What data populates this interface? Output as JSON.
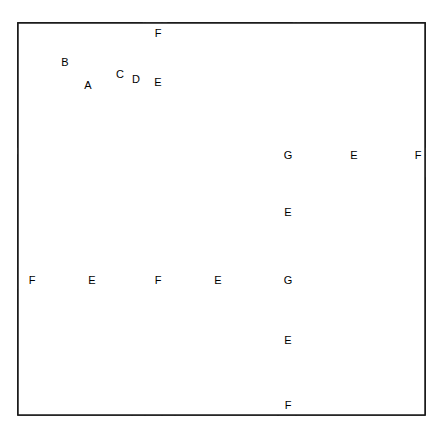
{
  "diagram": {
    "type": "quilt-piecing-diagram",
    "background_color": "#ffffff",
    "line_color": "#1a1a1a",
    "outer_frame": {
      "x": 18,
      "y": 23,
      "width": 407,
      "height": 392
    },
    "grid": {
      "rows": 3,
      "cols": 3,
      "blocks_total": 9
    },
    "piece_labels": [
      "A",
      "B",
      "C",
      "D",
      "E",
      "F",
      "G"
    ],
    "legend": {
      "A": "center square",
      "B": "corner triangle on center square",
      "C": "short log strip",
      "D": "long log strip",
      "E": "long sashing strip",
      "F": "small corner square",
      "G": "sashing square"
    },
    "labels": [
      {
        "text": "A",
        "x": 88,
        "y": 85
      },
      {
        "text": "B",
        "x": 65,
        "y": 62
      },
      {
        "text": "C",
        "x": 120,
        "y": 74
      },
      {
        "text": "D",
        "x": 136,
        "y": 79
      },
      {
        "text": "E",
        "x": 158,
        "y": 82
      },
      {
        "text": "F",
        "x": 158,
        "y": 33
      },
      {
        "text": "G",
        "x": 288,
        "y": 155
      },
      {
        "text": "E",
        "x": 354,
        "y": 155
      },
      {
        "text": "F",
        "x": 418,
        "y": 155
      },
      {
        "text": "E",
        "x": 288,
        "y": 212
      },
      {
        "text": "F",
        "x": 32,
        "y": 280
      },
      {
        "text": "E",
        "x": 92,
        "y": 280
      },
      {
        "text": "F",
        "x": 158,
        "y": 280
      },
      {
        "text": "E",
        "x": 218,
        "y": 280
      },
      {
        "text": "G",
        "x": 288,
        "y": 280
      },
      {
        "text": "E",
        "x": 288,
        "y": 340
      },
      {
        "text": "F",
        "x": 288,
        "y": 405
      }
    ],
    "blocks": [
      {
        "id": "block-r1c1",
        "row": 1,
        "col": 1,
        "x": 18,
        "y": 23,
        "size": 124,
        "rotation": 0,
        "diagonal": "up-right"
      },
      {
        "id": "block-r1c2",
        "row": 1,
        "col": 2,
        "x": 168,
        "y": 23,
        "size": 124,
        "rotation": 90,
        "diagonal": "down-right"
      },
      {
        "id": "block-r1c3",
        "row": 1,
        "col": 3,
        "x": 301,
        "y": 23,
        "size": 124,
        "rotation": 90,
        "diagonal": "down-right"
      },
      {
        "id": "block-r2c1",
        "row": 2,
        "col": 1,
        "x": 18,
        "y": 155,
        "size": 124,
        "rotation": 180,
        "diagonal": "up-right"
      },
      {
        "id": "block-r2c2",
        "row": 2,
        "col": 2,
        "x": 150,
        "y": 155,
        "size": 124,
        "rotation": 180,
        "diagonal": "up-right"
      },
      {
        "id": "block-r2c3",
        "row": 2,
        "col": 3,
        "x": 301,
        "y": 178,
        "size": 124,
        "rotation": 270,
        "diagonal": "up-right"
      },
      {
        "id": "block-r3c1",
        "row": 3,
        "col": 1,
        "x": 18,
        "y": 290,
        "size": 124,
        "rotation": 0,
        "diagonal": "down-right"
      },
      {
        "id": "block-r3c2",
        "row": 3,
        "col": 2,
        "x": 150,
        "y": 290,
        "size": 124,
        "rotation": 0,
        "diagonal": "down-right"
      },
      {
        "id": "block-r3c3",
        "row": 3,
        "col": 3,
        "x": 301,
        "y": 290,
        "size": 124,
        "rotation": 0,
        "diagonal": "down-right"
      }
    ]
  }
}
